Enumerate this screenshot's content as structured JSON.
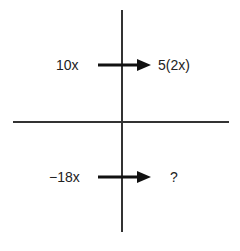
{
  "diagram": {
    "quadrants": {
      "top": {
        "input": "10x",
        "output": "5(2x)"
      },
      "bottom": {
        "input": "−18x",
        "output": "?"
      }
    },
    "colors": {
      "lines": "#333333",
      "arrows": "#111111",
      "text": "#222222"
    }
  }
}
